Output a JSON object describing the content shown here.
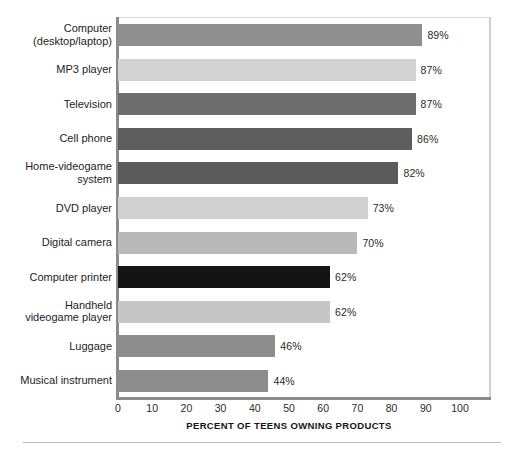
{
  "chart_data": {
    "type": "bar",
    "orientation": "horizontal",
    "title": "",
    "xlabel": "PERCENT OF TEENS OWNING PRODUCTS",
    "ylabel": "",
    "xlim": [
      0,
      100
    ],
    "xticks": [
      "0",
      "10",
      "20",
      "30",
      "40",
      "50",
      "60",
      "70",
      "80",
      "90",
      "100"
    ],
    "grid": false,
    "legend": "none",
    "categories": [
      "Computer\n(desktop/laptop)",
      "MP3 player",
      "Television",
      "Cell phone",
      "Home-videogame\nsystem",
      "DVD player",
      "Digital camera",
      "Computer printer",
      "Handheld\nvideogame player",
      "Luggage",
      "Musical instrument"
    ],
    "values": [
      89,
      87,
      87,
      86,
      82,
      73,
      70,
      62,
      62,
      46,
      44
    ],
    "value_labels": [
      "89%",
      "87%",
      "87%",
      "86%",
      "82%",
      "73%",
      "70%",
      "62%",
      "62%",
      "46%",
      "44%"
    ],
    "bar_colors": [
      "#8f8f8f",
      "#d2d2d2",
      "#6e6e6e",
      "#5e5e5e",
      "#5a5a5a",
      "#d0d0d0",
      "#b9b9b9",
      "#141414",
      "#c6c6c6",
      "#8d8d8d",
      "#8d8d8d"
    ],
    "axis_color": "#8b8b8b"
  },
  "rows": [
    {
      "label_line1": "Computer",
      "label_line2": "(desktop/laptop)",
      "value": 89,
      "value_label": "89%",
      "color": "#8f8f8f"
    },
    {
      "label_line1": "MP3 player",
      "label_line2": "",
      "value": 87,
      "value_label": "87%",
      "color": "#d2d2d2"
    },
    {
      "label_line1": "Television",
      "label_line2": "",
      "value": 87,
      "value_label": "87%",
      "color": "#6e6e6e"
    },
    {
      "label_line1": "Cell phone",
      "label_line2": "",
      "value": 86,
      "value_label": "86%",
      "color": "#5e5e5e"
    },
    {
      "label_line1": "Home-videogame",
      "label_line2": "system",
      "value": 82,
      "value_label": "82%",
      "color": "#5a5a5a"
    },
    {
      "label_line1": "DVD player",
      "label_line2": "",
      "value": 73,
      "value_label": "73%",
      "color": "#d0d0d0"
    },
    {
      "label_line1": "Digital camera",
      "label_line2": "",
      "value": 70,
      "value_label": "70%",
      "color": "#b9b9b9"
    },
    {
      "label_line1": "Computer printer",
      "label_line2": "",
      "value": 62,
      "value_label": "62%",
      "color": "#141414"
    },
    {
      "label_line1": "Handheld",
      "label_line2": "videogame player",
      "value": 62,
      "value_label": "62%",
      "color": "#c6c6c6"
    },
    {
      "label_line1": "Luggage",
      "label_line2": "",
      "value": 46,
      "value_label": "46%",
      "color": "#8d8d8d"
    },
    {
      "label_line1": "Musical instrument",
      "label_line2": "",
      "value": 44,
      "value_label": "44%",
      "color": "#8d8d8d"
    }
  ],
  "axis": {
    "title": "PERCENT OF TEENS OWNING PRODUCTS",
    "ticks": [
      "0",
      "10",
      "20",
      "30",
      "40",
      "50",
      "60",
      "70",
      "80",
      "90",
      "100"
    ]
  }
}
